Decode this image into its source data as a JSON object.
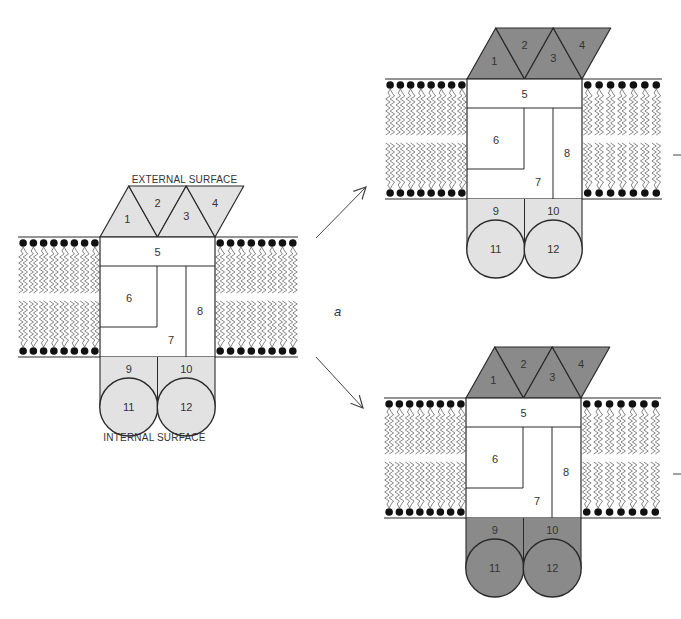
{
  "figure": {
    "panel_label": "a",
    "labels": {
      "external_surface": "EXTERNAL SURFACE",
      "internal_surface": "INTERNAL SURFACE"
    },
    "colors": {
      "light_gray": "#e2e2e2",
      "dark_gray": "#8a8a8a",
      "stroke": "#2a2a2a",
      "lipid": "#555555"
    },
    "subunits": [
      "1",
      "2",
      "3",
      "4",
      "5",
      "6",
      "7",
      "8",
      "9",
      "10",
      "11",
      "12"
    ],
    "diagrams": [
      {
        "id": "original",
        "origin_x": 100,
        "membrane_top_y": 237,
        "membrane_bottom_y": 357,
        "membrane_left_x": 18,
        "membrane_right_x": 298,
        "top_fill": "light",
        "bottom_fill": "light",
        "show_captions": true
      },
      {
        "id": "variant-top",
        "origin_x": 467,
        "membrane_top_y": 79,
        "membrane_bottom_y": 199,
        "membrane_left_x": 385,
        "membrane_right_x": 662,
        "top_fill": "dark",
        "bottom_fill": "light",
        "show_captions": false
      },
      {
        "id": "variant-bottom",
        "origin_x": 466,
        "membrane_top_y": 398,
        "membrane_bottom_y": 518,
        "membrane_left_x": 384,
        "membrane_right_x": 661,
        "top_fill": "dark",
        "bottom_fill": "dark",
        "show_captions": false
      }
    ],
    "arrows": [
      {
        "from": [
          316,
          238
        ],
        "to": [
          366,
          187
        ]
      },
      {
        "from": [
          316,
          357
        ],
        "to": [
          363,
          408
        ]
      }
    ],
    "side_marks": [
      {
        "x1": 673,
        "y1": 155,
        "x2": 681,
        "y2": 155
      },
      {
        "x1": 673,
        "y1": 474,
        "x2": 681,
        "y2": 474
      }
    ],
    "panel_label_pos": [
      334,
      316
    ]
  }
}
